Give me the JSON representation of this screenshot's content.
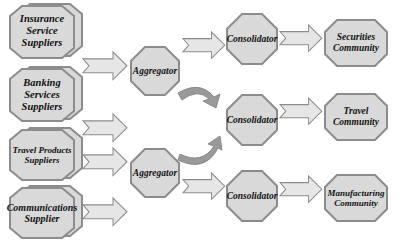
{
  "diagram": {
    "type": "flow",
    "colors": {
      "fill": "#d9d9d9",
      "stroke": "#8c8c8c",
      "arrow_fill": "#e6e6e6",
      "curve_arrow_fill": "#9a9a9a",
      "text": "#111111"
    },
    "suppliers": [
      {
        "label": "Insurance\nService\nSuppliers"
      },
      {
        "label": "Banking\nServices\nSuppliers"
      },
      {
        "label": "Travel Products\nSuppliers"
      },
      {
        "label": "Communications\nSupplier"
      }
    ],
    "aggregators": [
      {
        "label": "Aggregator"
      },
      {
        "label": "Aggregator"
      }
    ],
    "consolidators": [
      {
        "label": "Consolidator"
      },
      {
        "label": "Consolidator"
      },
      {
        "label": "Consolidator"
      }
    ],
    "communities": [
      {
        "label": "Securities\nCommunity"
      },
      {
        "label": "Travel\nCommunity"
      },
      {
        "label": "Manufacturing\nCommunity"
      }
    ],
    "edges": [
      {
        "from": "suppliers.0",
        "to": "aggregators.0"
      },
      {
        "from": "suppliers.1",
        "to": "aggregators.0"
      },
      {
        "from": "suppliers.2",
        "to": "aggregators.1"
      },
      {
        "from": "suppliers.3",
        "to": "aggregators.1"
      },
      {
        "from": "aggregators.0",
        "to": "consolidators.0"
      },
      {
        "from": "aggregators.0",
        "to": "consolidators.1",
        "style": "curved"
      },
      {
        "from": "aggregators.1",
        "to": "consolidators.1",
        "style": "curved"
      },
      {
        "from": "aggregators.1",
        "to": "consolidators.2"
      },
      {
        "from": "consolidators.0",
        "to": "communities.0"
      },
      {
        "from": "consolidators.1",
        "to": "communities.1"
      },
      {
        "from": "consolidators.2",
        "to": "communities.2"
      }
    ]
  }
}
